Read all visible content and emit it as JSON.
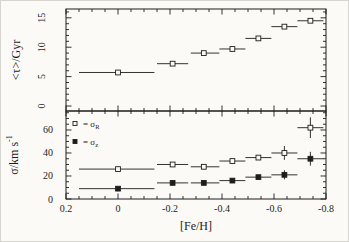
{
  "figure": {
    "bg": "#fbfaf6",
    "ink": "#1d1d1d"
  },
  "chart_data": [
    {
      "type": "scatter",
      "panel": "top",
      "title": "",
      "xlabel": "",
      "ylabel": "<τ>/Gyr",
      "xlim": [
        0.2,
        -0.8
      ],
      "ylim": [
        -0.85,
        16.5
      ],
      "xtick_values": [
        0.2,
        0,
        -0.2,
        -0.4,
        -0.6,
        -0.8
      ],
      "xtick_labels": [],
      "ytick_values": [
        0,
        5,
        10,
        15
      ],
      "ytick_labels": [
        "0",
        "5",
        "10",
        "15"
      ],
      "ytick_label_rotated": true,
      "x_minor_step": 0.05,
      "y_minor_step": 1,
      "grid": false,
      "series": [
        {
          "name": "mean-age",
          "marker": "open-square",
          "x": [
            0.0,
            -0.21,
            -0.33,
            -0.44,
            -0.54,
            -0.64,
            -0.74
          ],
          "y": [
            5.7,
            7.2,
            9.0,
            9.7,
            11.5,
            13.5,
            14.5
          ],
          "bin_lo": [
            0.15,
            -0.15,
            -0.28,
            -0.39,
            -0.49,
            -0.59,
            -0.69
          ],
          "bin_hi": [
            -0.14,
            -0.27,
            -0.39,
            -0.49,
            -0.59,
            -0.69,
            -0.79
          ],
          "yerr": [
            0,
            0,
            0,
            0,
            0,
            0,
            0
          ]
        }
      ]
    },
    {
      "type": "scatter",
      "panel": "bottom",
      "title": "",
      "xlabel": "[Fe/H]",
      "ylabel_main": "σ/km s",
      "ylabel_sup": "-1",
      "xlim": [
        0.2,
        -0.8
      ],
      "ylim": [
        0,
        76.5
      ],
      "xtick_values": [
        0.2,
        0,
        -0.2,
        -0.4,
        -0.6,
        -0.8
      ],
      "xtick_labels": [
        "0.2",
        "0",
        "-0.2",
        "-0.4",
        "-0.6",
        "-0.8"
      ],
      "ytick_values": [
        0,
        20,
        40,
        60
      ],
      "ytick_labels": [
        "0",
        "20",
        "40",
        "60"
      ],
      "ytick_label_rotated": false,
      "x_minor_step": 0.05,
      "y_minor_step": 5,
      "grid": false,
      "legend_position": "top-left-inside",
      "legend": [
        {
          "marker": "open-square",
          "text": "= σ",
          "sub": "R"
        },
        {
          "marker": "filled-square",
          "text": "= σ",
          "sub": "z"
        }
      ],
      "series": [
        {
          "name": "sigma-R",
          "marker": "open-square",
          "x": [
            0.0,
            -0.21,
            -0.33,
            -0.44,
            -0.54,
            -0.64,
            -0.74
          ],
          "y": [
            26,
            30,
            28,
            33,
            36,
            40,
            62
          ],
          "bin_lo": [
            0.15,
            -0.15,
            -0.28,
            -0.39,
            -0.49,
            -0.59,
            -0.69
          ],
          "bin_hi": [
            -0.14,
            -0.27,
            -0.39,
            -0.49,
            -0.59,
            -0.69,
            -0.79
          ],
          "yerr": [
            0,
            0,
            0,
            0,
            0,
            6,
            9
          ]
        },
        {
          "name": "sigma-z",
          "marker": "filled-square",
          "x": [
            0.0,
            -0.21,
            -0.33,
            -0.44,
            -0.54,
            -0.64,
            -0.74
          ],
          "y": [
            9,
            14,
            14,
            16,
            19,
            21,
            35
          ],
          "bin_lo": [
            0.15,
            -0.15,
            -0.28,
            -0.39,
            -0.49,
            -0.59,
            -0.69
          ],
          "bin_hi": [
            -0.14,
            -0.27,
            -0.39,
            -0.49,
            -0.59,
            -0.69,
            -0.79
          ],
          "yerr": [
            0,
            0,
            0,
            0,
            0,
            4,
            6
          ]
        }
      ]
    }
  ]
}
